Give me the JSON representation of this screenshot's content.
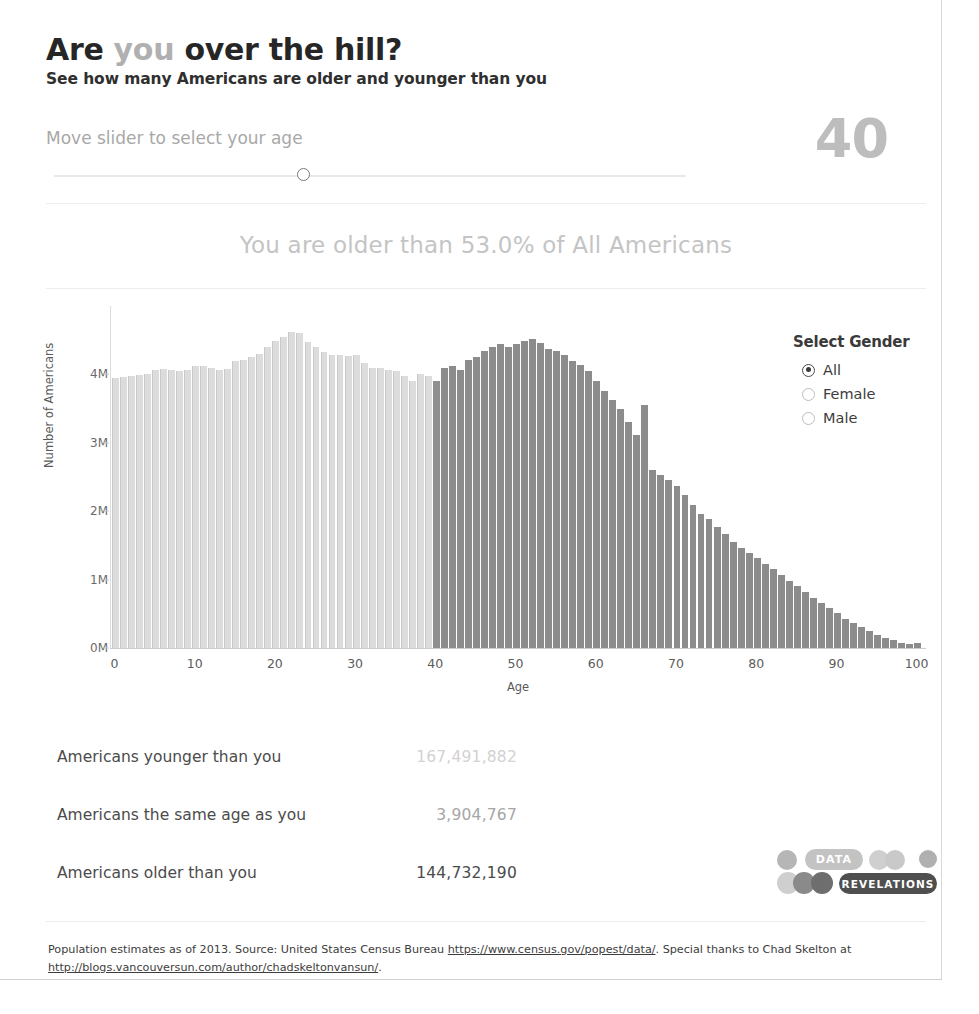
{
  "header": {
    "title_part1": "Are ",
    "title_highlight": "you",
    "title_part2": " over the hill?",
    "subtitle": "See how many Americans are older and younger than you"
  },
  "slider": {
    "label": "Move slider to select your age",
    "value": "40",
    "min": 0,
    "max": 100
  },
  "headline": {
    "text": "You are older than 53.0% of All Americans",
    "percent": "53.0%"
  },
  "gender": {
    "title": "Select Gender",
    "options": [
      {
        "label": "All",
        "selected": true
      },
      {
        "label": "Female",
        "selected": false
      },
      {
        "label": "Male",
        "selected": false
      }
    ]
  },
  "stats": [
    {
      "label": "Americans younger than you",
      "value": "167,491,882",
      "tone": "v-light"
    },
    {
      "label": "Americans the same age as you",
      "value": "3,904,767",
      "tone": "v-medium"
    },
    {
      "label": "Americans older than you",
      "value": "144,732,190",
      "tone": "v-dark"
    }
  ],
  "logo": {
    "word_top": "DATA",
    "word_bottom": "REVELATIONS"
  },
  "footer": {
    "line1_a": "Population estimates as of 2013. Source: United States Census Bureau ",
    "link1": "https://www.census.gov/popest/data/",
    "line1_b": ". Special thanks to Chad Skelton",
    "line2_a": "at ",
    "link2": "http://blogs.vancouversun.com/author/chadskeltonvansun/",
    "line2_b": "."
  },
  "colors": {
    "bar_younger": "#dcdcdc",
    "bar_older": "#8c8c8c",
    "headline_gray": "#c4c4c4",
    "value_gray": "#bdbdbd"
  },
  "chart_data": {
    "type": "bar",
    "title": "",
    "xlabel": "Age",
    "ylabel": "Number of Americans",
    "xlim": [
      0,
      100
    ],
    "ylim": [
      0,
      5000000
    ],
    "grid": false,
    "legend": "none",
    "selected_age": 40,
    "ytick_labels": [
      "0M",
      "1M",
      "2M",
      "3M",
      "4M"
    ],
    "ytick_values": [
      0,
      1000000,
      2000000,
      3000000,
      4000000
    ],
    "xtick_labels": [
      "0",
      "10",
      "20",
      "30",
      "40",
      "50",
      "60",
      "70",
      "80",
      "90",
      "100"
    ],
    "xtick_values": [
      0,
      10,
      20,
      30,
      40,
      50,
      60,
      70,
      80,
      90,
      100
    ],
    "categories": [
      0,
      1,
      2,
      3,
      4,
      5,
      6,
      7,
      8,
      9,
      10,
      11,
      12,
      13,
      14,
      15,
      16,
      17,
      18,
      19,
      20,
      21,
      22,
      23,
      24,
      25,
      26,
      27,
      28,
      29,
      30,
      31,
      32,
      33,
      34,
      35,
      36,
      37,
      38,
      39,
      40,
      41,
      42,
      43,
      44,
      45,
      46,
      47,
      48,
      49,
      50,
      51,
      52,
      53,
      54,
      55,
      56,
      57,
      58,
      59,
      60,
      61,
      62,
      63,
      64,
      65,
      66,
      67,
      68,
      69,
      70,
      71,
      72,
      73,
      74,
      75,
      76,
      77,
      78,
      79,
      80,
      81,
      82,
      83,
      84,
      85,
      86,
      87,
      88,
      89,
      90,
      91,
      92,
      93,
      94,
      95,
      96,
      97,
      98,
      99,
      100
    ],
    "values": [
      3950000,
      3960000,
      3975000,
      3985000,
      4000000,
      4060000,
      4075000,
      4070000,
      4055000,
      4065000,
      4120000,
      4130000,
      4090000,
      4070000,
      4085000,
      4195000,
      4215000,
      4255000,
      4300000,
      4395000,
      4490000,
      4545000,
      4620000,
      4600000,
      4480000,
      4400000,
      4330000,
      4290000,
      4290000,
      4270000,
      4280000,
      4170000,
      4090000,
      4090000,
      4060000,
      4055000,
      3980000,
      3905000,
      4010000,
      3980000,
      3905000,
      4095000,
      4130000,
      4060000,
      4210000,
      4260000,
      4345000,
      4395000,
      4440000,
      4400000,
      4440000,
      4490000,
      4520000,
      4465000,
      4370000,
      4340000,
      4280000,
      4200000,
      4140000,
      4055000,
      3900000,
      3760000,
      3630000,
      3490000,
      3300000,
      3110000,
      3550000,
      2605000,
      2530000,
      2450000,
      2370000,
      2240000,
      2095000,
      1960000,
      1880000,
      1775000,
      1670000,
      1555000,
      1460000,
      1390000,
      1320000,
      1235000,
      1160000,
      1070000,
      980000,
      900000,
      815000,
      735000,
      655000,
      580000,
      505000,
      430000,
      365000,
      300000,
      245000,
      195000,
      150000,
      110000,
      78000,
      52000,
      70000
    ],
    "series_split": {
      "younger_label": "Ages below selected age",
      "younger_color": "#dcdcdc",
      "older_label": "Selected age and above",
      "older_color": "#8c8c8c"
    }
  }
}
